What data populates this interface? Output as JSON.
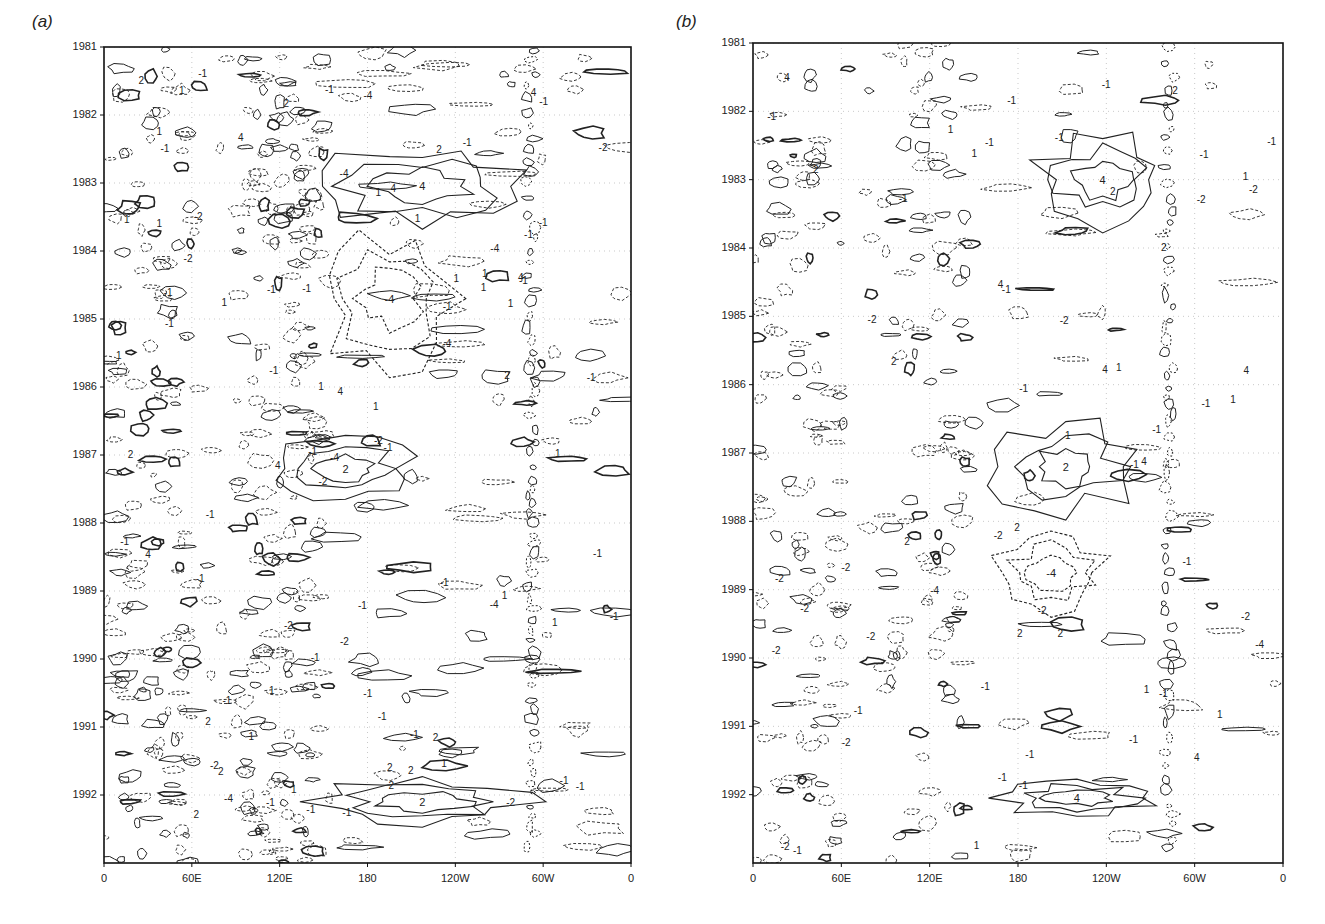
{
  "figure": {
    "panels": [
      {
        "id": "a",
        "label": "(a)"
      },
      {
        "id": "b",
        "label": "(b)"
      }
    ]
  },
  "chart_data": [
    {
      "type": "heatmap",
      "subtype": "contour (Hovmöller longitude-time diagram)",
      "panel_label": "(a)",
      "title": "",
      "xlabel": "",
      "ylabel": "",
      "x_ticks": [
        "0",
        "60E",
        "120E",
        "180",
        "120W",
        "60W",
        "0"
      ],
      "x_tick_degrees_east": [
        0,
        60,
        120,
        180,
        240,
        300,
        360
      ],
      "y_ticks": [
        "1981",
        "1982",
        "1983",
        "1984",
        "1985",
        "1986",
        "1987",
        "1988",
        "1989",
        "1990",
        "1991",
        "1992"
      ],
      "xlim": [
        0,
        360
      ],
      "ylim": [
        "1981",
        "1992 (end)"
      ],
      "y_direction": "time increases downward",
      "grid": "dotted light grid at tick positions",
      "contour_levels_labeled": [
        -4,
        -2,
        -1,
        1,
        2,
        4
      ],
      "contour_style": {
        "positive": "solid",
        "negative": "dashed"
      },
      "notable_features": [
        {
          "label": "positive band",
          "years": "1982.5-1983.6",
          "lon_range": "150E-75W",
          "max_label": 4
        },
        {
          "label": "positive band",
          "years": "1986.8-1987.6",
          "lon_range": "120E-150W",
          "max_label": 2
        },
        {
          "label": "positive band",
          "years": "1991.8-1992.4",
          "lon_range": "150E-75W",
          "max_label": 2
        },
        {
          "label": "negative region",
          "years": "1983.8-1985.6",
          "lon_range": "150E-120W",
          "min_label": -4
        },
        {
          "label": "dense small-scale contours",
          "lon_range": "0-60E and 90E-150E",
          "years": "all"
        },
        {
          "label": "vertical contour column",
          "lon_range": "~70W-60W",
          "years": "all"
        }
      ]
    },
    {
      "type": "heatmap",
      "subtype": "contour (Hovmöller longitude-time diagram)",
      "panel_label": "(b)",
      "title": "",
      "xlabel": "",
      "ylabel": "",
      "x_ticks": [
        "0",
        "60E",
        "120E",
        "180",
        "120W",
        "60W",
        "0"
      ],
      "x_tick_degrees_east": [
        0,
        60,
        120,
        180,
        240,
        300,
        360
      ],
      "y_ticks": [
        "1981",
        "1982",
        "1983",
        "1984",
        "1985",
        "1986",
        "1987",
        "1988",
        "1989",
        "1990",
        "1991",
        "1992"
      ],
      "xlim": [
        0,
        360
      ],
      "ylim": [
        "1981",
        "1992 (end)"
      ],
      "y_direction": "time increases downward",
      "grid": "dotted light grid at tick positions",
      "contour_levels_labeled": [
        -4,
        -2,
        -1,
        1,
        2,
        4
      ],
      "contour_style": {
        "positive": "solid",
        "negative": "dashed"
      },
      "notable_features": [
        {
          "label": "positive band",
          "years": "1982.4-1983.6",
          "lon_range": "165W-80W",
          "max_label": 4
        },
        {
          "label": "positive band",
          "years": "1986.6-1987.8",
          "lon_range": "165E-100W",
          "max_label": 2
        },
        {
          "label": "positive band",
          "years": "1991.8-1992.3",
          "lon_range": "170E-90W",
          "max_label": 4
        },
        {
          "label": "negative region",
          "years": "1988.2-1989.3",
          "lon_range": "165E-120W",
          "min_label": -4
        },
        {
          "label": "sparse small contours",
          "lon_range": "0-150E",
          "years": "all"
        },
        {
          "label": "vertical contour column",
          "lon_range": "~78W",
          "years": "all"
        }
      ]
    }
  ]
}
